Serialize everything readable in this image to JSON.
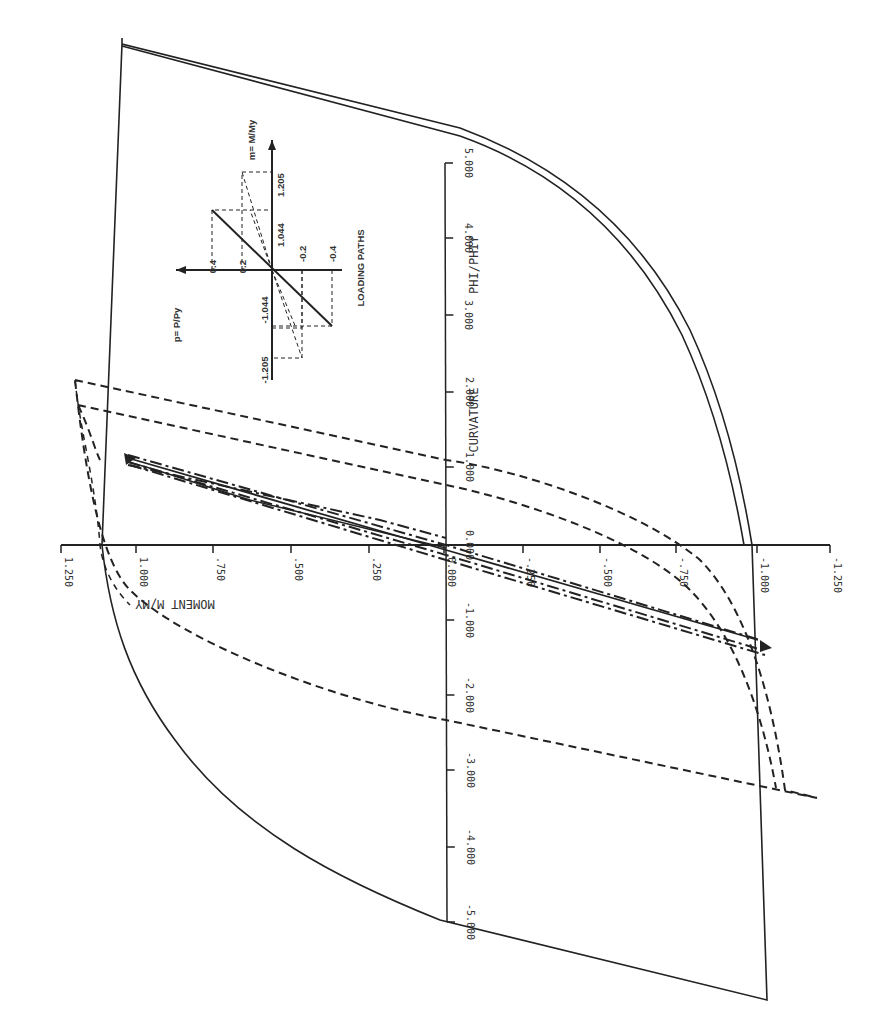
{
  "chart_data": {
    "type": "line",
    "title": "",
    "orientation_note": "rotated 90deg clockwise",
    "xlabel": "CURVATURE  PHI/PHIY",
    "ylabel": "MOMENT  M/MY",
    "xlim": [
      -5.0,
      5.0
    ],
    "ylim": [
      -1.25,
      1.25
    ],
    "x_ticks": [
      "-5.000",
      "-4.000",
      "-3.000",
      "-2.000",
      "-1.000",
      "0.000",
      "1.000",
      "2.000",
      "3.000",
      "4.000",
      "5.000"
    ],
    "y_ticks": [
      "1.250",
      "1.000",
      ".750",
      ".500",
      ".250",
      "0.000",
      "-.250",
      "-.500",
      "-.750",
      "-1.000",
      "-1.250"
    ],
    "grid": false,
    "series": [
      {
        "name": "Solid loop A (P/Py=0)",
        "style": "solid",
        "points": [
          [
            0,
            0
          ],
          [
            1.0,
            0.98
          ],
          [
            2.0,
            1.02
          ],
          [
            4.9,
            1.05
          ],
          [
            5.0,
            1.08
          ],
          [
            4.0,
            0.98
          ],
          [
            3.0,
            0.5
          ],
          [
            2.0,
            -0.3
          ],
          [
            1.0,
            -0.9
          ],
          [
            0,
            -0.98
          ],
          [
            -5.0,
            -1.08
          ],
          [
            -4.0,
            -0.98
          ],
          [
            -3.0,
            -0.6
          ],
          [
            -1.0,
            0.6
          ],
          [
            0,
            0.98
          ],
          [
            5.0,
            1.08
          ]
        ]
      },
      {
        "name": "Solid loop B",
        "style": "solid",
        "points": [
          [
            0,
            0
          ],
          [
            1.0,
            0.98
          ],
          [
            2.0,
            1.02
          ],
          [
            4.9,
            1.03
          ],
          [
            5.0,
            1.06
          ],
          [
            4.0,
            0.96
          ],
          [
            3.0,
            0.48
          ],
          [
            2.0,
            -0.32
          ],
          [
            1.0,
            -0.92
          ],
          [
            0,
            -1.0
          ]
        ]
      },
      {
        "name": "Dashed loop (P/Py=0.2, m=1.205)",
        "style": "dashed",
        "points": [
          [
            0,
            0
          ],
          [
            1.0,
            0.62
          ],
          [
            1.9,
            1.2
          ],
          [
            0.9,
            1.0
          ],
          [
            -1.0,
            0.5
          ],
          [
            -2.0,
            -0.2
          ],
          [
            -2.8,
            -0.9
          ],
          [
            -3.6,
            -1.14
          ],
          [
            -3.7,
            -1.05
          ],
          [
            -1.0,
            -0.6
          ],
          [
            0.5,
            0.1
          ],
          [
            1.8,
            1.14
          ]
        ]
      },
      {
        "name": "Dash-dot path (P/Py=0.4, m=1.044)",
        "style": "dashdot",
        "points": [
          [
            0,
            0
          ],
          [
            1.15,
            0.98
          ],
          [
            0,
            0.02
          ],
          [
            -1.2,
            -1.0
          ],
          [
            0,
            -0.05
          ],
          [
            1.15,
            0.98
          ]
        ]
      }
    ],
    "inset": {
      "title": "LOADING PATHS",
      "p_label": "p = P/Py",
      "m_label": "m = M/My",
      "p_ticks": [
        "0.4",
        "0.2",
        "-0.2",
        "-0.4"
      ],
      "m_ticks": [
        "1.205",
        "1.044",
        "-1.044",
        "-1.205"
      ]
    }
  },
  "labels": {
    "moment_axis_title": "MOMENT  M/MY",
    "curvature_axis_title_1": "CURVATURE",
    "curvature_axis_title_2": "PHI/PHIY",
    "inset_title": "LOADING PATHS",
    "inset_p": "p= P/Py",
    "inset_m": "m= M/My",
    "inset_tick_04": "0.4",
    "inset_tick_02": "0.2",
    "inset_tick_m02": "-0.2",
    "inset_tick_m04": "-0.4",
    "inset_tick_1044": "1.044",
    "inset_tick_1205": "1.205",
    "inset_tick_m1044": "-1.044",
    "inset_tick_m1205": "-1.205"
  },
  "moment_ticks": [
    {
      "label": "1.250",
      "x": 61
    },
    {
      "label": "1.000",
      "x": 136
    },
    {
      "label": ".750",
      "x": 213
    },
    {
      "label": ".500",
      "x": 291
    },
    {
      "label": ".250",
      "x": 369
    },
    {
      "label": "0.000",
      "x": 444
    },
    {
      "label": "-.250",
      "x": 523
    },
    {
      "label": "-.500",
      "x": 600
    },
    {
      "label": "-.750",
      "x": 676
    },
    {
      "label": "-1.000",
      "x": 757
    },
    {
      "label": "-1.250",
      "x": 830
    }
  ],
  "curvature_ticks": [
    {
      "label": "5.000",
      "y": 163
    },
    {
      "label": "4.000",
      "y": 238
    },
    {
      "label": "3.000",
      "y": 315
    },
    {
      "label": "2.000",
      "y": 392
    },
    {
      "label": "1.000",
      "y": 467
    },
    {
      "label": "0.000",
      "y": 545
    },
    {
      "label": "-1.000",
      "y": 620
    },
    {
      "label": "-2.000",
      "y": 695
    },
    {
      "label": "-3.000",
      "y": 770
    },
    {
      "label": "-4.000",
      "y": 847
    },
    {
      "label": "-5.000",
      "y": 922
    }
  ]
}
